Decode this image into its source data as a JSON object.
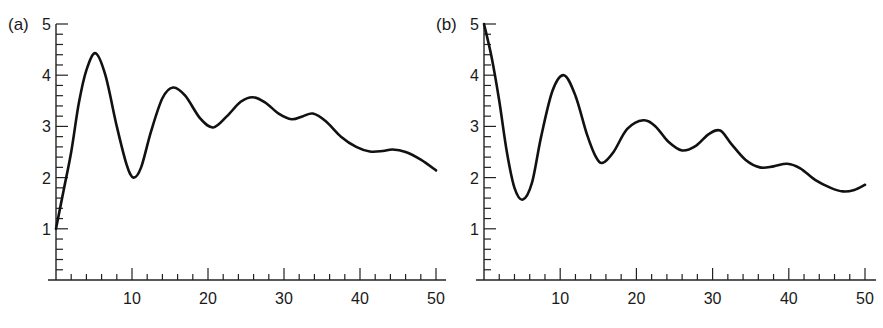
{
  "figure": {
    "panels": [
      {
        "id": "a",
        "label": "(a)"
      },
      {
        "id": "b",
        "label": "(b)"
      }
    ]
  },
  "style": {
    "line_color": "#111111",
    "axis_color": "#222222",
    "background": "#ffffff"
  },
  "chart_data": [
    {
      "type": "line",
      "panel_label": "(a)",
      "title": "",
      "xlabel": "",
      "ylabel": "",
      "xlim": [
        0,
        50
      ],
      "ylim": [
        0,
        5
      ],
      "xticks": [
        10,
        20,
        30,
        40,
        50
      ],
      "yticks": [
        1,
        2,
        3,
        4,
        5
      ],
      "x_minor_step": 2,
      "y_minor_step": 0.2,
      "grid": false,
      "legend": null,
      "series": [
        {
          "name": "(a)",
          "x": [
            0,
            1,
            2,
            3,
            4,
            5.2,
            6.5,
            8,
            9.3,
            10.2,
            11.2,
            12.5,
            14,
            15.4,
            17,
            19,
            20.7,
            22.5,
            24.3,
            25.9,
            27.5,
            29.3,
            31,
            32.5,
            33.8,
            35.5,
            37.5,
            39.5,
            41.3,
            43,
            44.3,
            46,
            48,
            50
          ],
          "y": [
            1.0,
            1.75,
            2.5,
            3.45,
            4.1,
            4.43,
            4.0,
            3.0,
            2.25,
            2.0,
            2.2,
            2.9,
            3.55,
            3.76,
            3.6,
            3.15,
            2.98,
            3.2,
            3.48,
            3.57,
            3.47,
            3.25,
            3.14,
            3.2,
            3.25,
            3.1,
            2.8,
            2.6,
            2.51,
            2.52,
            2.55,
            2.5,
            2.35,
            2.14
          ]
        }
      ]
    },
    {
      "type": "line",
      "panel_label": "(b)",
      "title": "",
      "xlabel": "",
      "ylabel": "",
      "xlim": [
        0,
        50
      ],
      "ylim": [
        0,
        5
      ],
      "xticks": [
        10,
        20,
        30,
        40,
        50
      ],
      "yticks": [
        1,
        2,
        3,
        4,
        5
      ],
      "x_minor_step": 2,
      "y_minor_step": 0.2,
      "grid": false,
      "legend": null,
      "series": [
        {
          "name": "(b)",
          "x": [
            0,
            1,
            2,
            3,
            4,
            5.1,
            6.3,
            7.5,
            9,
            10.5,
            12,
            13.5,
            14.7,
            15.6,
            17,
            18.8,
            20.9,
            22.5,
            24.2,
            26,
            27.8,
            29.5,
            31,
            32.5,
            34.3,
            36.2,
            38,
            39.8,
            41.5,
            43.5,
            45.5,
            47.1,
            48.6,
            50
          ],
          "y": [
            5.0,
            4.35,
            3.5,
            2.5,
            1.8,
            1.57,
            1.9,
            2.8,
            3.7,
            4.0,
            3.6,
            2.85,
            2.4,
            2.29,
            2.5,
            2.95,
            3.12,
            3.0,
            2.7,
            2.53,
            2.62,
            2.85,
            2.92,
            2.65,
            2.35,
            2.2,
            2.22,
            2.27,
            2.18,
            1.95,
            1.8,
            1.73,
            1.76,
            1.86
          ]
        }
      ]
    }
  ]
}
